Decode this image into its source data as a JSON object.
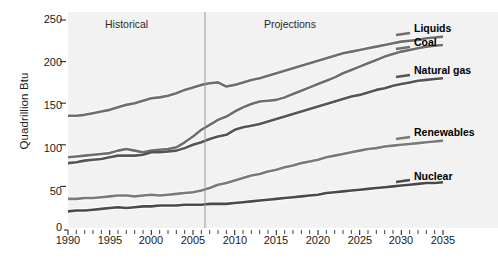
{
  "chart_data": {
    "type": "line",
    "title": "",
    "xlabel": "",
    "ylabel": "Quadrillion Btu",
    "xlim": [
      1990,
      2035
    ],
    "ylim": [
      0,
      250
    ],
    "grid": false,
    "legend_position": "right-inline",
    "x_ticks": [
      1990,
      1995,
      2000,
      2005,
      2010,
      2015,
      2020,
      2025,
      2030,
      2035
    ],
    "y_ticks": [
      0,
      50,
      100,
      150,
      200,
      250
    ],
    "minor_x_tick_interval": 1,
    "annotations": [
      {
        "text": "Historical",
        "x": 1998,
        "y": 243
      },
      {
        "text": "Projections",
        "x": 2019,
        "y": 243
      }
    ],
    "divider": {
      "x": 2008,
      "label": "history/projection boundary",
      "color": "#9a9a9a"
    },
    "x": [
      1990,
      1991,
      1992,
      1993,
      1994,
      1995,
      1996,
      1997,
      1998,
      1999,
      2000,
      2001,
      2002,
      2003,
      2004,
      2005,
      2006,
      2007,
      2008,
      2009,
      2010,
      2011,
      2012,
      2013,
      2014,
      2015,
      2016,
      2017,
      2018,
      2019,
      2020,
      2021,
      2022,
      2023,
      2024,
      2025,
      2026,
      2027,
      2028,
      2029,
      2030,
      2031,
      2032,
      2033,
      2034,
      2035
    ],
    "series": [
      {
        "name": "Liquids",
        "color": "#6e6e6e",
        "values": [
          135,
          135,
          136,
          138,
          140,
          142,
          145,
          148,
          150,
          153,
          156,
          157,
          159,
          162,
          166,
          169,
          172,
          174,
          175,
          170,
          172,
          175,
          178,
          180,
          183,
          186,
          189,
          192,
          195,
          198,
          201,
          204,
          207,
          210,
          212,
          214,
          216,
          218,
          220,
          222,
          224,
          225,
          226,
          228,
          229,
          230
        ]
      },
      {
        "name": "Coal",
        "color": "#6e6e6e",
        "values": [
          85,
          86,
          87,
          88,
          89,
          90,
          93,
          95,
          93,
          91,
          93,
          94,
          95,
          97,
          103,
          110,
          118,
          124,
          130,
          134,
          140,
          145,
          149,
          152,
          153,
          154,
          157,
          161,
          165,
          169,
          173,
          177,
          181,
          186,
          190,
          194,
          198,
          202,
          206,
          209,
          212,
          214,
          216,
          218,
          219,
          220
        ]
      },
      {
        "name": "Natural gas",
        "color": "#555555",
        "values": [
          78,
          79,
          81,
          82,
          83,
          85,
          87,
          87,
          87,
          88,
          91,
          91,
          92,
          93,
          96,
          100,
          103,
          107,
          110,
          112,
          118,
          121,
          123,
          125,
          128,
          131,
          134,
          137,
          140,
          143,
          146,
          149,
          152,
          155,
          158,
          160,
          163,
          166,
          168,
          171,
          173,
          175,
          177,
          178,
          179,
          180
        ]
      },
      {
        "name": "Renewables",
        "color": "#7a7a7a",
        "values": [
          35,
          35,
          36,
          36,
          37,
          38,
          39,
          39,
          38,
          39,
          40,
          39,
          40,
          41,
          42,
          43,
          45,
          48,
          52,
          54,
          57,
          60,
          63,
          65,
          68,
          70,
          73,
          75,
          78,
          80,
          82,
          85,
          87,
          89,
          91,
          93,
          95,
          96,
          98,
          99,
          100,
          101,
          102,
          103,
          104,
          105
        ]
      },
      {
        "name": "Nuclear",
        "color": "#4a4a4a",
        "values": [
          20,
          21,
          21,
          22,
          23,
          24,
          25,
          24,
          25,
          26,
          26,
          27,
          27,
          27,
          28,
          28,
          28,
          29,
          29,
          29,
          30,
          31,
          32,
          33,
          34,
          35,
          36,
          37,
          38,
          39,
          40,
          42,
          43,
          44,
          45,
          46,
          47,
          48,
          49,
          50,
          51,
          52,
          53,
          54,
          54,
          55
        ]
      }
    ],
    "series_label_positions": [
      {
        "name": "Liquids",
        "left": 414,
        "top": 28
      },
      {
        "name": "Coal",
        "left": 414,
        "top": 42
      },
      {
        "name": "Natural gas",
        "left": 414,
        "top": 70
      },
      {
        "name": "Renewables",
        "left": 414,
        "top": 132
      },
      {
        "name": "Nuclear",
        "left": 414,
        "top": 175
      }
    ]
  },
  "axis": {
    "y_label": "Quadrillion Btu",
    "y_tick_labels": [
      "250",
      "200",
      "150",
      "100",
      "50",
      "0"
    ],
    "x_tick_labels": [
      "1990",
      "1995",
      "2000",
      "2005",
      "2010",
      "2015",
      "2020",
      "2025",
      "2030",
      "2035"
    ]
  },
  "labels": {
    "historical": "Historical",
    "projections": "Projections",
    "liquids": "Liquids",
    "coal": "Coal",
    "natural_gas": "Natural gas",
    "renewables": "Renewables",
    "nuclear": "Nuclear"
  },
  "colors": {
    "plot_background": "#f2f2f2",
    "page_background": "#ffffff",
    "divider": "#9a9a9a",
    "text": "#1a1a1a",
    "line_liquids": "#6e6e6e",
    "line_coal": "#6e6e6e",
    "line_natural_gas": "#555555",
    "line_renewables": "#7a7a7a",
    "line_nuclear": "#4a4a4a"
  }
}
